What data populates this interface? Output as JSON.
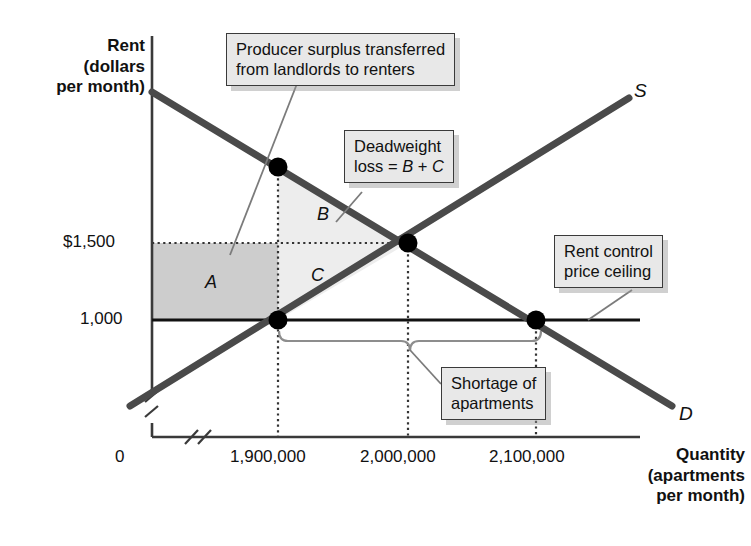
{
  "figure": {
    "type": "economics-supply-demand-diagram",
    "title_visible": false,
    "axes": {
      "y_title_lines": [
        "Rent",
        "(dollars",
        "per month)"
      ],
      "x_title_lines": [
        "Quantity",
        "(apartments",
        "per month)"
      ],
      "origin_label": "0",
      "y_ticks": [
        "$1,500",
        "1,000"
      ],
      "x_ticks": [
        "1,900,000",
        "2,000,000",
        "2,100,000"
      ],
      "axis_breaks": true
    },
    "curves": [
      {
        "name": "supply",
        "label": "S"
      },
      {
        "name": "demand",
        "label": "D"
      }
    ],
    "regions": [
      {
        "id": "A",
        "label": "A",
        "fill": "#cdcdcd",
        "meaning": "producer surplus transferred from landlords to renters"
      },
      {
        "id": "B",
        "label": "B",
        "fill": "#ededed",
        "meaning": "deadweight loss portion"
      },
      {
        "id": "C",
        "label": "C",
        "fill": "#ededed",
        "meaning": "deadweight loss portion"
      }
    ],
    "callouts": [
      {
        "id": "producer-surplus",
        "lines": [
          "Producer surplus transferred",
          "from landlords to renters"
        ]
      },
      {
        "id": "deadweight-loss",
        "lines": [
          "Deadweight",
          "loss = B + C"
        ]
      },
      {
        "id": "rent-control",
        "lines": [
          "Rent control",
          "price ceiling"
        ]
      },
      {
        "id": "shortage",
        "lines": [
          "Shortage of",
          "apartments"
        ]
      }
    ],
    "colors": {
      "curve": "#4a4a4a",
      "axis": "#3a3a3a",
      "region_a": "#cdcdcd",
      "region_bc": "#ededed",
      "callout_bg": "#e8e8e8",
      "callout_border": "#3a3a3a",
      "point": "#000000"
    }
  },
  "chart_data": {
    "type": "line",
    "title": "",
    "xlabel": "Quantity (apartments per month)",
    "ylabel": "Rent (dollars per month)",
    "xlim": [
      1850000,
      2200000
    ],
    "ylim": [
      0,
      2200
    ],
    "grid": false,
    "legend": "inline curve labels",
    "series": [
      {
        "name": "S",
        "label": "Supply",
        "x": [
          1850000,
          2200000
        ],
        "y": [
          600,
          2100
        ]
      },
      {
        "name": "D",
        "label": "Demand",
        "x": [
          1850000,
          2200000
        ],
        "y": [
          2050,
          620
        ]
      }
    ],
    "annotations": [
      {
        "label": "$1,500",
        "type": "price-line",
        "y": 1500,
        "note": "equilibrium rent"
      },
      {
        "label": "1,000",
        "type": "price-ceiling",
        "y": 1000,
        "note": "rent control price ceiling"
      },
      {
        "label": "1,900,000",
        "type": "quantity",
        "x": 1900000,
        "note": "quantity supplied under rent control"
      },
      {
        "label": "2,000,000",
        "type": "quantity",
        "x": 2000000,
        "note": "equilibrium quantity"
      },
      {
        "label": "2,100,000",
        "type": "quantity",
        "x": 2100000,
        "note": "quantity demanded under rent control"
      }
    ],
    "points": [
      {
        "x": 1900000,
        "y": 1750,
        "on": "D",
        "note": "demand at 1,900,000"
      },
      {
        "x": 2000000,
        "y": 1500,
        "on": "S,D",
        "note": "market equilibrium"
      },
      {
        "x": 1900000,
        "y": 1000,
        "on": "S",
        "note": "supply at price ceiling"
      },
      {
        "x": 2100000,
        "y": 1000,
        "on": "D",
        "note": "demand at price ceiling"
      }
    ],
    "shortage": {
      "from": 1900000,
      "to": 2100000,
      "amount": 200000
    }
  }
}
